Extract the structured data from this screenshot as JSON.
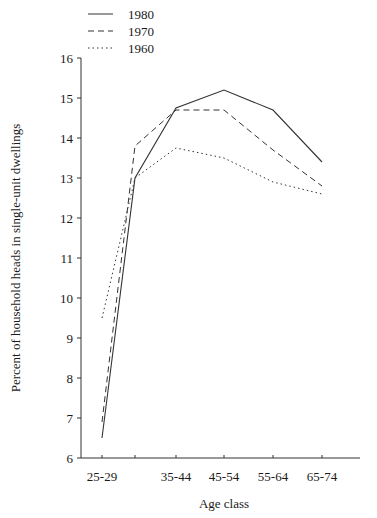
{
  "chart_data": {
    "type": "line",
    "title": "",
    "xlabel": "Age class",
    "ylabel": "Percent of household heads in single-unit dwellings",
    "categories": [
      "25-29",
      "30-34",
      "35-44",
      "45-54",
      "55-64",
      "65-74"
    ],
    "x_tick_labels": [
      "25-29",
      "35-44",
      "45-54",
      "55-64",
      "65-74"
    ],
    "y_ticks": [
      6,
      7,
      8,
      9,
      10,
      11,
      12,
      13,
      14,
      15,
      16
    ],
    "ylim": [
      6,
      16
    ],
    "grid": false,
    "legend_position": "top-left",
    "series": [
      {
        "name": "1980",
        "style": "solid",
        "values": [
          6.5,
          13.0,
          14.75,
          15.2,
          14.7,
          13.4
        ]
      },
      {
        "name": "1970",
        "style": "dashed",
        "values": [
          6.9,
          13.8,
          14.7,
          14.7,
          13.7,
          12.8
        ]
      },
      {
        "name": "1960",
        "style": "dotted",
        "values": [
          9.5,
          13.0,
          13.75,
          13.5,
          12.9,
          12.6
        ]
      }
    ]
  },
  "legend": {
    "items": [
      {
        "label": "1980",
        "style": "solid"
      },
      {
        "label": "1970",
        "style": "dashed"
      },
      {
        "label": "1960",
        "style": "dotted"
      }
    ]
  },
  "axes": {
    "x_title": "Age class",
    "y_title": "Percent of household heads in single-unit dwellings"
  },
  "colors": {
    "line": "#333333",
    "axis": "#333333"
  }
}
